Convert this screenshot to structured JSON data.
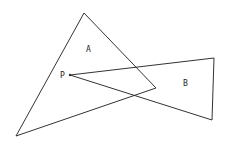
{
  "diagram": {
    "stroke_color": "#333333",
    "background": "#ffffff",
    "triangle_a": {
      "label": "A",
      "points": "84,13 16,136 156,88",
      "label_pos": [
        86,
        52
      ]
    },
    "triangle_b": {
      "label": "B",
      "points": "70,75 214,58 212,120",
      "label_pos": [
        183,
        86
      ]
    },
    "point_p": {
      "label": "P",
      "pos": [
        70,
        75
      ],
      "label_pos": [
        60,
        78
      ]
    }
  }
}
